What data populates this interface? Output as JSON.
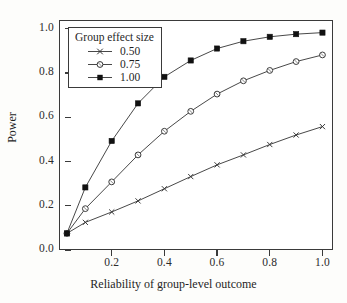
{
  "chart_data": {
    "type": "line",
    "title": "",
    "xlabel": "Reliability of group-level outcome",
    "ylabel": "Power",
    "xlim": [
      0.0,
      1.04
    ],
    "ylim": [
      0.0,
      1.04
    ],
    "xticks": [
      0.2,
      0.4,
      0.6,
      0.8,
      1.0
    ],
    "xtick_labels": [
      "0.2",
      "0.4",
      "0.6",
      "0.8",
      "1.0"
    ],
    "yticks": [
      0.0,
      0.2,
      0.4,
      0.6,
      0.8,
      1.0
    ],
    "ytick_labels": [
      "0.0",
      "0.2",
      "0.4",
      "0.6",
      "0.8",
      "1.0"
    ],
    "grid": false,
    "legend_position": "upper left",
    "legend_title": "Group effect size",
    "x": [
      0.03,
      0.1,
      0.2,
      0.3,
      0.4,
      0.5,
      0.6,
      0.7,
      0.8,
      0.9,
      1.0
    ],
    "series": [
      {
        "name": "0.50",
        "marker": "x-marker",
        "values": [
          0.075,
          0.125,
          0.172,
          0.222,
          0.277,
          0.332,
          0.385,
          0.43,
          0.477,
          0.52,
          0.558
        ]
      },
      {
        "name": "0.75",
        "marker": "open-circle-marker",
        "values": [
          0.075,
          0.187,
          0.308,
          0.43,
          0.537,
          0.627,
          0.705,
          0.765,
          0.812,
          0.852,
          0.882
        ]
      },
      {
        "name": "1.00",
        "marker": "filled-square-marker",
        "values": [
          0.075,
          0.283,
          0.493,
          0.663,
          0.783,
          0.857,
          0.911,
          0.944,
          0.964,
          0.976,
          0.983
        ]
      }
    ]
  },
  "axes": {
    "x_title": "Reliability of group-level outcome",
    "y_title": "Power"
  },
  "legend": {
    "title": "Group effect size",
    "entries": [
      {
        "label": "0.50",
        "marker": "x-marker"
      },
      {
        "label": "0.75",
        "marker": "open-circle-marker"
      },
      {
        "label": "1.00",
        "marker": "filled-square-marker"
      }
    ]
  },
  "style": {
    "line_color": "#333333",
    "frame_color": "#3a3a3a",
    "text_color": "#1f1f1f",
    "background": "#ffffff"
  }
}
